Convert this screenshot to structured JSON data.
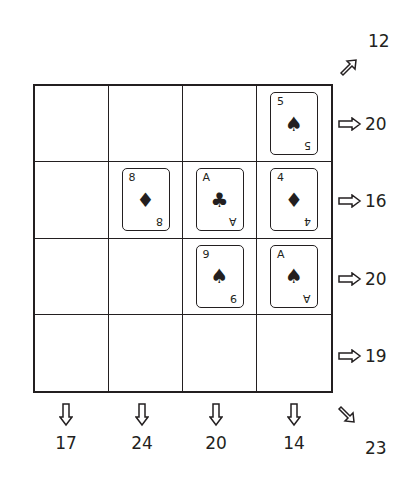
{
  "puzzle": {
    "grid_size": {
      "rows": 4,
      "cols": 4
    },
    "cells": [
      [
        null,
        null,
        null,
        {
          "rank": "5",
          "suit": "spade",
          "suit_glyph": "♠"
        }
      ],
      [
        null,
        {
          "rank": "8",
          "suit": "diamond",
          "suit_glyph": "♦"
        },
        {
          "rank": "A",
          "suit": "club",
          "suit_glyph": "♣"
        },
        {
          "rank": "4",
          "suit": "diamond",
          "suit_glyph": "♦"
        }
      ],
      [
        null,
        null,
        {
          "rank": "9",
          "suit": "spade",
          "suit_glyph": "♠"
        },
        {
          "rank": "A",
          "suit": "spade",
          "suit_glyph": "♠"
        }
      ],
      [
        null,
        null,
        null,
        null
      ]
    ],
    "row_sums": [
      "20",
      "16",
      "20",
      "19"
    ],
    "col_sums": [
      "17",
      "24",
      "20",
      "14"
    ],
    "diagonal_up_sum": "12",
    "diagonal_down_sum": "23",
    "icons": {
      "row_arrow": "arrow-right-icon",
      "col_arrow": "arrow-down-icon",
      "diag_up_arrow": "arrow-up-right-icon",
      "diag_down_arrow": "arrow-down-right-icon"
    }
  }
}
